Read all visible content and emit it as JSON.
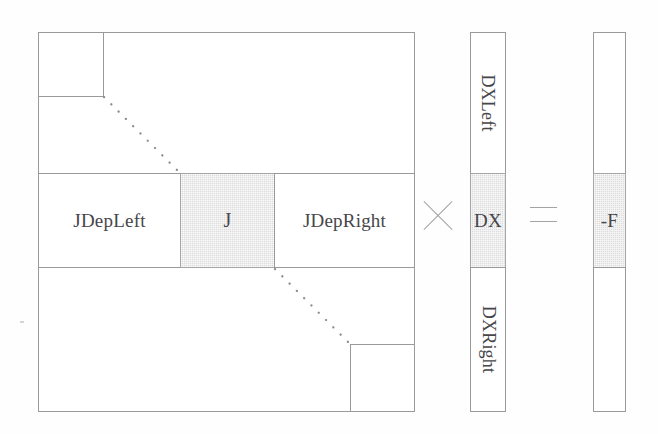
{
  "figure": {
    "kind": "matrix-equation-block-diagram",
    "colors": {
      "line": "#9a9a9a",
      "shade": "#dcdcdc",
      "text": "#46464a",
      "background": "#ffffff"
    },
    "jacobian_matrix": {
      "name": "jacobian-block-matrix",
      "corner_blocks": [
        {
          "name": "top-left-diagonal-block",
          "label": ""
        },
        {
          "name": "bottom-right-diagonal-block",
          "label": ""
        }
      ],
      "middle_row_blocks": [
        {
          "name": "jdepleft-block",
          "label": "JDepLeft",
          "shaded": false
        },
        {
          "name": "j-block",
          "label": "J",
          "shaded": true
        },
        {
          "name": "jdepright-block",
          "label": "JDepRight",
          "shaded": false
        }
      ],
      "ellipsis": [
        {
          "name": "upper-diagonal-dots",
          "dots": 8
        },
        {
          "name": "lower-diagonal-dots",
          "dots": 8
        }
      ]
    },
    "operators": {
      "multiply": {
        "name": "multiply-operator",
        "glyph": "×"
      },
      "equals": {
        "name": "equals-operator",
        "glyph": "="
      }
    },
    "dx_vector": {
      "name": "dx-solution-vector",
      "segments": [
        {
          "name": "dxleft-segment",
          "label": "DXLeft",
          "shaded": false,
          "rotated": true
        },
        {
          "name": "dx-segment",
          "label": "DX",
          "shaded": true,
          "rotated": false
        },
        {
          "name": "dxright-segment",
          "label": "DXRight",
          "shaded": false,
          "rotated": true
        }
      ]
    },
    "rhs_vector": {
      "name": "residual-vector",
      "segments": [
        {
          "name": "rhs-top-segment",
          "label": "",
          "shaded": false
        },
        {
          "name": "minus-f-segment",
          "label": "-F",
          "shaded": true
        },
        {
          "name": "rhs-bottom-segment",
          "label": "",
          "shaded": false
        }
      ]
    }
  }
}
